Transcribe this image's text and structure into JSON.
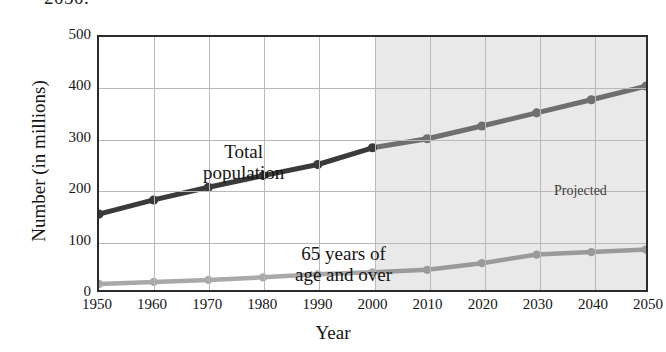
{
  "caption": {
    "clipped_text": "2050."
  },
  "chart_data": {
    "type": "line",
    "title": "",
    "xlabel": "Year",
    "ylabel": "Number (in millions)",
    "x": [
      1950,
      1960,
      1970,
      1980,
      1990,
      2000,
      2010,
      2020,
      2030,
      2040,
      2050
    ],
    "categories": [
      "1950",
      "1960",
      "1970",
      "1980",
      "1990",
      "2000",
      "2010",
      "2020",
      "2030",
      "2040",
      "2050"
    ],
    "xlim": [
      1950,
      2050
    ],
    "ylim": [
      0,
      500
    ],
    "yticks": [
      0,
      100,
      200,
      300,
      400,
      500
    ],
    "ytick_labels": [
      "0",
      "100",
      "200",
      "300",
      "400",
      "500"
    ],
    "grid": true,
    "legend": "none (inline annotations)",
    "series": [
      {
        "name": "Total population",
        "values": [
          150,
          178,
          203,
          226,
          248,
          281,
          299,
          324,
          350,
          376,
          403
        ],
        "color_historical": "#3a3a3a",
        "color_projected": "#6f6f6f"
      },
      {
        "name": "65 years of age and over",
        "values": [
          12,
          16,
          20,
          25,
          31,
          35,
          40,
          53,
          70,
          75,
          80
        ],
        "color_historical": "#a9a9a9",
        "color_projected": "#9a9a9a"
      }
    ],
    "annotations": [
      {
        "name": "total-population-label",
        "text_line1": "Total",
        "text_line2": "population"
      },
      {
        "name": "elderly-label",
        "text_line1": "65 years of",
        "text_line2": "age and over"
      },
      {
        "name": "projected-label",
        "text": "Projected"
      }
    ],
    "projection": {
      "label": "Projected",
      "start_year": 2000,
      "shade_color": "#e9e9e9"
    }
  }
}
